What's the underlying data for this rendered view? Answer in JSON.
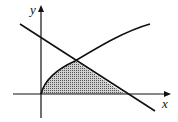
{
  "diagram": {
    "axes": {
      "x_label": "x",
      "y_label": "y"
    },
    "curves": [
      {
        "name": "increasing-curve",
        "description": "concave curve from origin rising to upper right"
      },
      {
        "name": "decreasing-line",
        "description": "straight line with negative slope crossing y-axis and x-axis"
      }
    ],
    "shaded_region": "region bounded by the curve, the line, and the x-axis",
    "colors": {
      "stroke": "#111111",
      "shade": "#9a9a9a",
      "background": "#ffffff"
    }
  }
}
